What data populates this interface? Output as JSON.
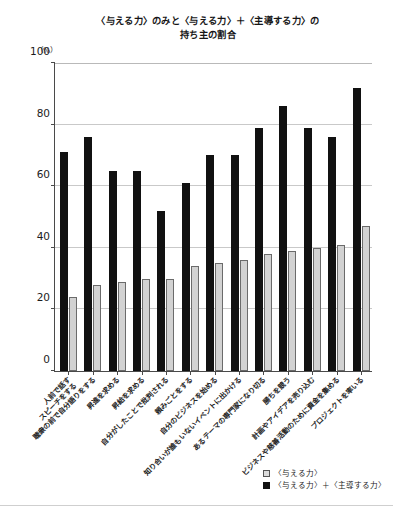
{
  "chart_data": {
    "type": "bar",
    "title": "〈与える力〉のみと〈与える力〉＋〈主導する力〉の 持ち主の割合",
    "title_lines": [
      "〈与える力〉のみと〈与える力〉＋〈主導する力〉の",
      "持ち主の割合"
    ],
    "unit_label": "（%）",
    "xlabel": "",
    "ylabel": "",
    "ylim": [
      0,
      100
    ],
    "yticks": [
      0,
      20,
      40,
      60,
      80,
      100
    ],
    "ytick_labels": [
      "0",
      "20",
      "40",
      "60",
      "80",
      "100"
    ],
    "grid": true,
    "legend_position": "bottom-right",
    "categories": [
      "人前で話す／スピーチをする",
      "聴衆の前で自分語りをする",
      "昇進を求める",
      "昇給を求める",
      "自分がしたことで批判される",
      "頼みごとをする",
      "自分のビジネスを始める",
      "知り合いが誰もいないイベントに出かける",
      "あるテーマの専門家になり切る",
      "勝ちを競う",
      "計画やアイデアを売り込む",
      "ビジネスや慈善活動のために資金を集める",
      "プロジェクトを率いる"
    ],
    "series": [
      {
        "name": "〈与える力〉",
        "color": "#d2d2d2",
        "values": [
          24,
          28,
          29,
          30,
          30,
          34,
          35,
          36,
          38,
          39,
          40,
          41,
          47
        ]
      },
      {
        "name": "〈与える力〉＋〈主導する力〉",
        "color": "#111111",
        "values": [
          71,
          76,
          65,
          65,
          52,
          61,
          70,
          70,
          79,
          86,
          79,
          76,
          92
        ]
      }
    ]
  },
  "legend": {
    "items": [
      {
        "label": "〈与える力〉",
        "swatch": "light"
      },
      {
        "label": "〈与える力〉＋〈主導する力〉",
        "swatch": "dark"
      }
    ]
  }
}
